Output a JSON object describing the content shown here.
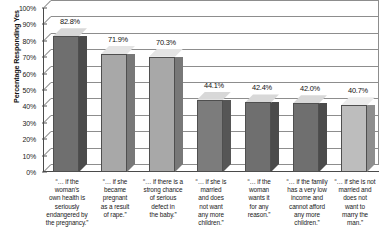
{
  "chart_data": {
    "type": "bar",
    "title": "",
    "xlabel": "",
    "ylabel": "Percentage Responding Yes",
    "ylim": [
      0,
      100
    ],
    "ytick_labels": [
      "100%",
      "90%",
      "80%",
      "70%",
      "60%",
      "50%",
      "40%",
      "30%",
      "20%",
      "10%",
      "0%"
    ],
    "ytick_values": [
      100,
      90,
      80,
      70,
      60,
      50,
      40,
      30,
      20,
      10,
      0
    ],
    "grid": true,
    "legend": "none",
    "style": "3d-column",
    "categories": [
      "“… if the woman’s own health is seriously endangered by the pregnancy.”",
      "“… if she became pregnant as a result of rape.”",
      "“… if there is a strong chance of serious defect in the baby.”",
      "“… if she is married and does not want any more children.”",
      "“… if the woman wants it for any reason.”",
      "“… if the family has a very low income and cannot afford any more children.”",
      "“… if she is not married and does not want to marry the man.”"
    ],
    "values": [
      82.8,
      71.9,
      70.3,
      44.1,
      42.4,
      42.0,
      40.7
    ],
    "value_labels": [
      "82.8%",
      "71.9%",
      "70.3%",
      "44.1%",
      "42.4%",
      "42.0%",
      "40.7%"
    ],
    "bar_colors": [
      "#6f6f6f",
      "#a8a8a8",
      "#a8a8a8",
      "#7c7c7c",
      "#6f6f6f",
      "#6f6f6f",
      "#bdbdbd"
    ],
    "bar_top_colors": [
      "#d8d8d8",
      "#e4e4e4",
      "#e4e4e4",
      "#d8d8d8",
      "#d8d8d8",
      "#d8d8d8",
      "#ececec"
    ],
    "bar_side_colors": [
      "#4b4b4b",
      "#787878",
      "#787878",
      "#565656",
      "#4b4b4b",
      "#4b4b4b",
      "#8e8e8e"
    ],
    "category_lines": [
      [
        "“… if the",
        "woman’s",
        "own health is",
        "seriously",
        "endangered by",
        "the pregnancy.”"
      ],
      [
        "“… if she",
        "became",
        "pregnant",
        "as a result",
        "of rape.”"
      ],
      [
        "“… if there is a",
        "strong chance",
        "of serious",
        "defect in",
        "the baby.”"
      ],
      [
        "“… if she is",
        "married",
        "and does",
        "not want",
        "any more",
        "children.”"
      ],
      [
        "“… if the",
        "woman",
        "wants it",
        "for any",
        "reason.”"
      ],
      [
        "“… if the family",
        "has a very low",
        "income and",
        "cannot afford",
        "any more",
        "children.”"
      ],
      [
        "“… if she is not",
        "married and",
        "does not",
        "want to",
        "marry the",
        "man.”"
      ]
    ]
  }
}
